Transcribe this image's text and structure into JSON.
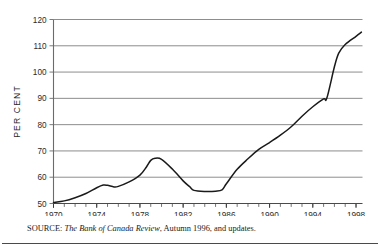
{
  "chart_data": {
    "type": "line",
    "title": "",
    "subtitle": "",
    "xlabel": "",
    "ylabel": "PER CENT",
    "xlim": [
      1970,
      1998.6
    ],
    "ylim": [
      50,
      120
    ],
    "yticks": [
      50,
      60,
      70,
      80,
      90,
      100,
      110,
      120
    ],
    "ytick_labels": [
      "50",
      "60",
      "70",
      "80",
      "90",
      "100",
      "110",
      "120"
    ],
    "xticks": [
      1970,
      1974,
      1978,
      1982,
      1986,
      1990,
      1994,
      1998
    ],
    "xtick_labels": [
      "1970",
      "1974",
      "1978",
      "1982",
      "1986",
      "1990",
      "1994",
      "1998"
    ],
    "x_minor_tick_interval": 1,
    "grid": "horizontal",
    "grid_color": "#808080",
    "line_color": "#1a1a1a",
    "legend": null,
    "legend_position": "none",
    "series": [
      {
        "name": "Ratio",
        "x": [
          1970,
          1971,
          1972,
          1973,
          1974,
          1974.6,
          1975,
          1975.6,
          1976,
          1977,
          1978,
          1978.6,
          1979,
          1979.4,
          1980,
          1981,
          1982,
          1982.6,
          1983,
          1984,
          1985,
          1985.6,
          1986,
          1987,
          1988,
          1989,
          1990,
          1991,
          1992,
          1993,
          1994,
          1995,
          1995.3,
          1996,
          1996.4,
          1997,
          1998,
          1998.5
        ],
        "values": [
          50.4,
          51.0,
          52.2,
          53.8,
          56.0,
          57.0,
          56.9,
          56.3,
          56.5,
          58.2,
          60.8,
          63.9,
          66.4,
          67.2,
          66.8,
          63.1,
          58.6,
          56.4,
          55.0,
          54.6,
          54.7,
          55.2,
          57.5,
          63.0,
          67.0,
          70.6,
          73.2,
          76.0,
          79.2,
          83.2,
          86.8,
          89.8,
          90.1,
          102.0,
          107.2,
          110.5,
          113.6,
          115.2
        ]
      }
    ]
  },
  "source": {
    "label": "SOURCE: ",
    "italic_part": "The Bank of Canada Review",
    "rest": ", Autumn 1996, and updates."
  }
}
